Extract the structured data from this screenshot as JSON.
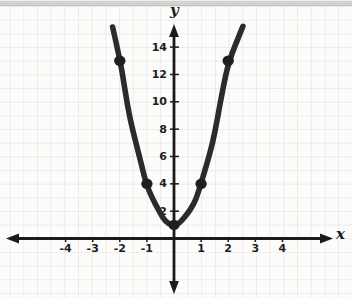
{
  "chart_data": {
    "type": "line",
    "title": "",
    "x_axis": {
      "label": "x",
      "ticks": [
        -4,
        -3,
        -2,
        -1,
        1,
        2,
        3,
        4
      ],
      "range": [
        -5,
        5
      ]
    },
    "y_axis": {
      "label": "y",
      "ticks": [
        2,
        4,
        6,
        8,
        10,
        12,
        14
      ],
      "range": [
        -2,
        16
      ]
    },
    "grid": true,
    "legend": false,
    "series": [
      {
        "name": "parabola",
        "points": [
          [
            -2.2,
            15.52
          ],
          [
            -2.0,
            13.0
          ],
          [
            -1.8,
            10.72
          ],
          [
            -1.6,
            8.68
          ],
          [
            -1.4,
            6.88
          ],
          [
            -1.2,
            5.32
          ],
          [
            -1.0,
            4.0
          ],
          [
            -0.8,
            2.92
          ],
          [
            -0.6,
            2.08
          ],
          [
            -0.4,
            1.48
          ],
          [
            -0.2,
            1.12
          ],
          [
            0.0,
            1.0
          ],
          [
            0.2,
            1.12
          ],
          [
            0.4,
            1.48
          ],
          [
            0.6,
            2.08
          ],
          [
            0.8,
            2.92
          ],
          [
            1.0,
            4.0
          ],
          [
            1.2,
            5.32
          ],
          [
            1.4,
            6.88
          ],
          [
            1.6,
            8.68
          ],
          [
            1.8,
            10.72
          ],
          [
            2.0,
            13.0
          ],
          [
            2.2,
            15.52
          ]
        ]
      }
    ],
    "marked_points": [
      [
        -2,
        13
      ],
      [
        -1,
        4
      ],
      [
        0,
        1
      ],
      [
        1,
        4
      ],
      [
        2,
        13
      ]
    ],
    "colors": {
      "curve": "#2b2b2b",
      "dots": "#1f1f1f",
      "axis": "#1b1b1b",
      "tick_text": "#1d1d1d",
      "paper": "#fcfcfb",
      "grid_line": "#e7e1dc",
      "top_strip": "#d2d2d0"
    }
  }
}
